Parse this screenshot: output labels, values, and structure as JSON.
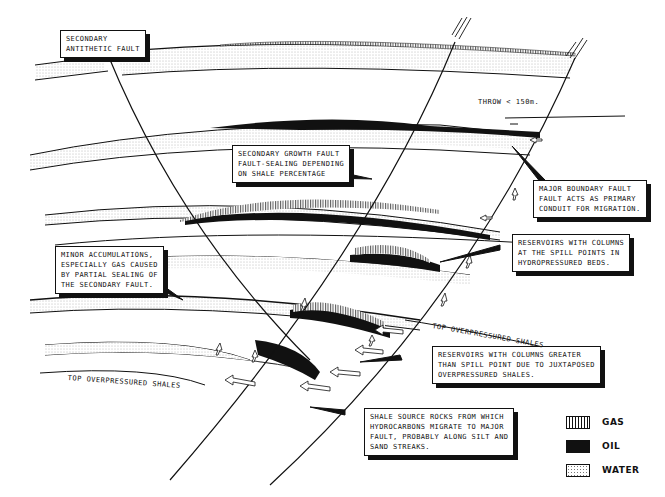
{
  "figure": {
    "colors": {
      "ink": "#111111",
      "paper": "#ffffff",
      "oil": "#111111",
      "water_dots": "#777777"
    }
  },
  "callouts": {
    "antithetic_fault": "SECONDARY\nANTITHETIC FAULT",
    "growth_fault": "SECONDARY GROWTH FAULT\nFAULT-SEALING DEPENDING\nON SHALE PERCENTAGE",
    "boundary_fault": "MAJOR BOUNDARY FAULT\nFAULT ACTS AS PRIMARY\nCONDUIT FOR MIGRATION.",
    "spill_points": "RESERVOIRS WITH COLUMNS\nAT THE SPILL POINTS IN\nHYDROPRESSURED BEDS.",
    "minor_accumulations": "MINOR ACCUMULATIONS,\nESPECIALLY GAS CAUSED\nBY PARTIAL SEALING OF\nTHE SECONDARY FAULT.",
    "greater_than_spill": "RESERVOIRS WITH COLUMNS GREATER\nTHAN SPILL POINT DUE TO JUXTAPOSED\nOVERPRESSURED SHALES.",
    "source_rocks": "SHALE SOURCE ROCKS FROM WHICH\nHYDROCARBONS MIGRATE TO MAJOR\nFAULT, PROBABLY ALONG SILT AND\nSAND STREAKS."
  },
  "labels": {
    "throw": "THROW < 150m.",
    "top_overpressured_right": "TOP OVERPRESSURED SHALES",
    "top_overpressured_left": "TOP OVERPRESSURED SHALES"
  },
  "legend": [
    {
      "key": "gas",
      "label": "GAS"
    },
    {
      "key": "oil",
      "label": "OIL"
    },
    {
      "key": "water",
      "label": "WATER"
    }
  ]
}
